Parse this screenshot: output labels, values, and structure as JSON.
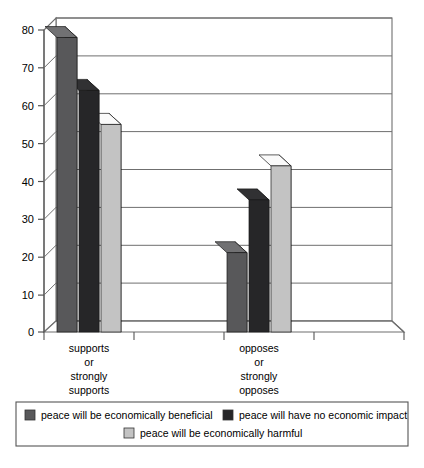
{
  "chart_data": {
    "type": "bar",
    "title": "",
    "subtitle": "",
    "xlabel": "",
    "ylabel": "",
    "categories": [
      "supports or strongly supports",
      "opposes or strongly opposes"
    ],
    "category_lines": [
      [
        "supports",
        "or",
        "strongly",
        "supports"
      ],
      [
        "opposes",
        "or",
        "strongly",
        "opposes"
      ]
    ],
    "series": [
      {
        "name": "peace will be economically beneficial",
        "values": [
          78,
          21
        ],
        "color": "#58585a"
      },
      {
        "name": "peace will have no economic impact",
        "values": [
          64,
          35
        ],
        "color": "#262628"
      },
      {
        "name": "peace will be economically harmful",
        "values": [
          55,
          44
        ],
        "color": "#c3c3c3"
      }
    ],
    "ylim": [
      0,
      80
    ],
    "yticks": [
      0,
      10,
      20,
      30,
      40,
      50,
      60,
      70,
      80
    ],
    "ytick_labels": [
      "0",
      "10",
      "20",
      "30",
      "40",
      "50",
      "60",
      "70",
      "80"
    ],
    "grid": true,
    "legend_position": "bottom",
    "style": "3d-column",
    "axis_color": "#555555",
    "grid_color": "#7a7a7a",
    "plot_background": "#ffffff",
    "legend_border_color": "#555555"
  },
  "legend": {
    "entries": [
      {
        "label": "peace will be economically beneficial",
        "color": "#58585a"
      },
      {
        "label": "peace will have no economic impact",
        "color": "#262628"
      },
      {
        "label": "peace will be economically harmful",
        "color": "#c3c3c3"
      }
    ]
  }
}
